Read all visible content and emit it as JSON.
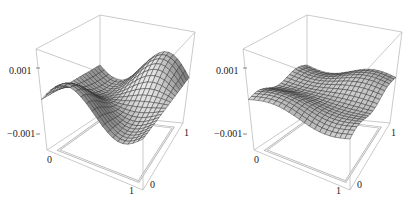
{
  "chart_data": [
    {
      "type": "surface3d",
      "title": "",
      "xlabel": "",
      "ylabel": "",
      "zlabel": "",
      "x_ticks": [
        "0",
        "1"
      ],
      "y_ticks": [
        "0",
        "1"
      ],
      "z_ticks": [
        "0.001",
        "-0.001"
      ],
      "xlim": [
        0,
        1
      ],
      "ylim": [
        0,
        1
      ],
      "zlim": [
        -0.0015,
        0.0015
      ],
      "grid_resolution": 20,
      "description": "Wavy surface with a pronounced saddle/ridge; amplitude about 0.0008"
    },
    {
      "type": "surface3d",
      "title": "",
      "xlabel": "",
      "ylabel": "",
      "zlabel": "",
      "x_ticks": [
        "0",
        "1"
      ],
      "y_ticks": [
        "0",
        "1"
      ],
      "z_ticks": [
        "0.001",
        "-0.001"
      ],
      "xlim": [
        0,
        1
      ],
      "ylim": [
        0,
        1
      ],
      "zlim": [
        -0.0015,
        0.0015
      ],
      "grid_resolution": 20,
      "description": "Nearly flat surface with small ripples; amplitude about 0.0003"
    }
  ],
  "panels": [
    {
      "z_top": "0.001",
      "z_bottom": "−0.001",
      "x0": "0",
      "x1": "1",
      "y0": "0",
      "y1": "1"
    },
    {
      "z_top": "0.001",
      "z_bottom": "−0.001",
      "x0": "0",
      "x1": "1",
      "y0": "0",
      "y1": "1"
    }
  ]
}
